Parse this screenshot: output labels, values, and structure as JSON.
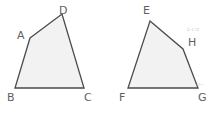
{
  "figure": {
    "canvas": {
      "width": 216,
      "height": 114
    },
    "colors": {
      "background": "#ffffff",
      "shape_fill": "#f2f2f2",
      "shape_stroke": "#4a4a4f",
      "label_text": "#5f5f63",
      "annotation_text": "#b9b9bd"
    },
    "stroke_width": 1.3,
    "shapes": [
      {
        "name": "quadrilateral-abcd",
        "label": "ABCD",
        "points": "30,38 62,14 84,88 15,88",
        "vertices": [
          {
            "label": "A",
            "x": 30,
            "y": 38
          },
          {
            "label": "D",
            "x": 62,
            "y": 14
          },
          {
            "label": "C",
            "x": 84,
            "y": 88
          },
          {
            "label": "B",
            "x": 15,
            "y": 88
          }
        ]
      },
      {
        "name": "quadrilateral-efgh",
        "label": "EFGH",
        "points": "150,21 183,49 198,88 128,88",
        "vertices": [
          {
            "label": "E",
            "x": 150,
            "y": 21
          },
          {
            "label": "H",
            "x": 183,
            "y": 49
          },
          {
            "label": "G",
            "x": 198,
            "y": 88
          },
          {
            "label": "F",
            "x": 128,
            "y": 88
          }
        ]
      }
    ],
    "labels": [
      {
        "name": "vertex-label-a",
        "text": "A",
        "left": 17,
        "top": 30
      },
      {
        "name": "vertex-label-d",
        "text": "D",
        "left": 59,
        "top": 5
      },
      {
        "name": "vertex-label-b",
        "text": "B",
        "left": 7,
        "top": 92
      },
      {
        "name": "vertex-label-c",
        "text": "C",
        "left": 84,
        "top": 92
      },
      {
        "name": "vertex-label-e",
        "text": "E",
        "left": 143,
        "top": 5
      },
      {
        "name": "vertex-label-h",
        "text": "H",
        "left": 188,
        "top": 37
      },
      {
        "name": "vertex-label-f",
        "text": "F",
        "left": 119,
        "top": 92
      },
      {
        "name": "vertex-label-g",
        "text": "G",
        "left": 198,
        "top": 92
      }
    ],
    "annotations": [
      {
        "name": "annotation-near-h",
        "text": "エイけ",
        "left": 186,
        "top": 28
      },
      {
        "name": "annotation-near-g",
        "text": "ジー",
        "left": 196,
        "top": 83
      }
    ]
  }
}
